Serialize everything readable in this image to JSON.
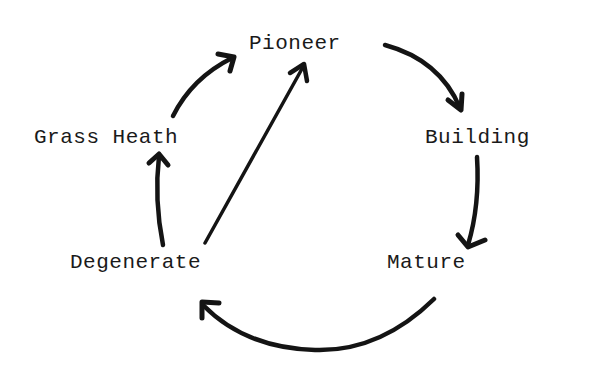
{
  "diagram": {
    "type": "cycle",
    "nodes": [
      {
        "id": "pioneer",
        "label": "Pioneer"
      },
      {
        "id": "building",
        "label": "Building"
      },
      {
        "id": "mature",
        "label": "Mature"
      },
      {
        "id": "degenerate",
        "label": "Degenerate"
      },
      {
        "id": "grass_heath",
        "label": "Grass Heath"
      }
    ],
    "edges": [
      {
        "from": "pioneer",
        "to": "building"
      },
      {
        "from": "building",
        "to": "mature"
      },
      {
        "from": "mature",
        "to": "degenerate"
      },
      {
        "from": "degenerate",
        "to": "grass_heath"
      },
      {
        "from": "grass_heath",
        "to": "pioneer"
      },
      {
        "from": "degenerate",
        "to": "pioneer"
      }
    ],
    "colors": {
      "ink": "#141414",
      "background": "#ffffff"
    }
  }
}
